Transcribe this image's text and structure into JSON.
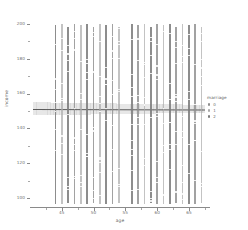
{
  "chart_data": {
    "type": "scatter",
    "title": "",
    "xlabel": "age",
    "ylabel": "income",
    "xlim": [
      40,
      68
    ],
    "ylim": [
      95,
      205
    ],
    "grid": false,
    "legend_position": "right",
    "xticks": [
      45,
      50,
      55,
      60,
      65
    ],
    "yticks": [
      100,
      120,
      140,
      160,
      180,
      200
    ],
    "xtick_labels": [
      "45",
      "50",
      "55",
      "60",
      "65"
    ],
    "ytick_labels": [
      "100",
      "120",
      "140",
      "160",
      "180",
      "200"
    ],
    "series": [
      {
        "name": "marriage = 0",
        "color": "#8e8e8e",
        "marker": "point",
        "x": [
          44,
          45,
          46,
          47,
          48,
          49,
          50,
          51,
          52,
          53,
          54,
          56,
          57,
          58,
          59,
          60,
          61,
          62,
          63,
          64,
          65,
          66,
          67
        ],
        "y": [
          152,
          151,
          153,
          150,
          152,
          151,
          153,
          152,
          150,
          151,
          152,
          153,
          151,
          152,
          150,
          152,
          151,
          153,
          152,
          151,
          152,
          150,
          152
        ]
      },
      {
        "name": "marriage = 1",
        "color": "#a9a9a9",
        "marker": "point",
        "x": [
          44,
          46,
          48,
          50,
          52,
          54,
          57,
          59,
          61,
          63,
          65,
          67
        ],
        "y": [
          149,
          150,
          151,
          150,
          149,
          151,
          150,
          151,
          149,
          150,
          151,
          150
        ]
      },
      {
        "name": "marriage = 2",
        "color": "#7d7d7d",
        "marker": "point",
        "x": [
          45,
          47,
          49,
          51,
          53,
          56,
          58,
          60,
          62,
          64,
          66
        ],
        "y": [
          153,
          152,
          154,
          153,
          152,
          153,
          154,
          152,
          153,
          152,
          153
        ]
      }
    ],
    "regression": {
      "label": "linear fit",
      "x": [
        40.5,
        67.5
      ],
      "y": [
        151.3,
        151.0
      ],
      "line_color": "#4f4f4f",
      "band_color": "#c9c9c9",
      "band_alpha": 0.45,
      "ci_low_left": 147.5,
      "ci_high_left": 155.0,
      "ci_low_right": 149.0,
      "ci_high_right": 153.5
    },
    "point_columns": [
      {
        "age": 44,
        "top": 199,
        "bottom": 97,
        "style": "dark"
      },
      {
        "age": 45,
        "top": 200,
        "bottom": 97,
        "style": "pale"
      },
      {
        "age": 46,
        "top": 198,
        "bottom": 97,
        "style": "dark"
      },
      {
        "age": 47,
        "top": 200,
        "bottom": 97,
        "style": "mid"
      },
      {
        "age": 48,
        "top": 199,
        "bottom": 97,
        "style": "pale"
      },
      {
        "age": 49,
        "top": 200,
        "bottom": 97,
        "style": "dark"
      },
      {
        "age": 50,
        "top": 198,
        "bottom": 97,
        "style": "mid"
      },
      {
        "age": 51,
        "top": 200,
        "bottom": 97,
        "style": "pale"
      },
      {
        "age": 52,
        "top": 199,
        "bottom": 97,
        "style": "dark"
      },
      {
        "age": 53,
        "top": 200,
        "bottom": 97,
        "style": "mid"
      },
      {
        "age": 54,
        "top": 198,
        "bottom": 97,
        "style": "pale"
      },
      {
        "age": 56,
        "top": 200,
        "bottom": 97,
        "style": "dark"
      },
      {
        "age": 57,
        "top": 199,
        "bottom": 97,
        "style": "mid"
      },
      {
        "age": 58,
        "top": 200,
        "bottom": 97,
        "style": "pale"
      },
      {
        "age": 59,
        "top": 198,
        "bottom": 97,
        "style": "dark"
      },
      {
        "age": 60,
        "top": 200,
        "bottom": 97,
        "style": "mid"
      },
      {
        "age": 61,
        "top": 199,
        "bottom": 97,
        "style": "pale"
      },
      {
        "age": 62,
        "top": 200,
        "bottom": 97,
        "style": "dark"
      },
      {
        "age": 63,
        "top": 198,
        "bottom": 97,
        "style": "mid"
      },
      {
        "age": 64,
        "top": 200,
        "bottom": 97,
        "style": "pale"
      },
      {
        "age": 65,
        "top": 199,
        "bottom": 97,
        "style": "dark"
      },
      {
        "age": 66,
        "top": 200,
        "bottom": 97,
        "style": "mid"
      },
      {
        "age": 67,
        "top": 198,
        "bottom": 97,
        "style": "pale"
      }
    ]
  },
  "axes": {
    "ylabel": "income",
    "xlabel": "age",
    "ytick_labels": [
      "200",
      "180",
      "160",
      "140",
      "120",
      "100"
    ],
    "xtick_labels": [
      "45",
      "50",
      "55",
      "60",
      "65"
    ]
  },
  "legend": {
    "title": "marriage",
    "items": [
      {
        "label": "0",
        "color": "#8e8e8e"
      },
      {
        "label": "1",
        "color": "#a9a9a9"
      },
      {
        "label": "2",
        "color": "#7d7d7d"
      }
    ]
  }
}
